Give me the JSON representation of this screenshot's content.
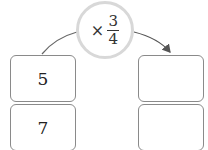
{
  "operator": {
    "symbol": "×",
    "fraction": {
      "numerator": "3",
      "denominator": "4"
    }
  },
  "left_column": [
    "5",
    "7"
  ],
  "right_column": [
    "",
    ""
  ],
  "colors": {
    "circle_border": "#d8d8d8",
    "box_border": "#8a8a8a",
    "arrow": "#555555"
  }
}
